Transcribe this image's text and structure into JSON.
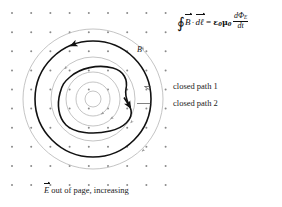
{
  "figure": {
    "equation": {
      "contour_integral_symbol": "∮",
      "lhs_field": "B",
      "dot": "·",
      "lhs_element": "dℓ",
      "equals": "=",
      "epsilon_zero": "ε",
      "epsilon_sub": "0",
      "mu_zero": "μ",
      "mu_sub": "0",
      "frac_numerator": "dΦ",
      "frac_numerator_sub": "E",
      "frac_denominator": "dt",
      "plain_text": "∮B⃗ · dℓ⃗ = ε₀μ₀ dΦ_E/dt"
    },
    "labels": {
      "b_field": "B",
      "closed_path_1": "closed path 1",
      "closed_path_2": "closed path 2",
      "caption_field": "E",
      "caption_text": "out of page, increasing"
    },
    "colors": {
      "ink": "#1a1a1a",
      "path_dark": "#111111",
      "field_line": "#b0b0b0",
      "dot": "#8a8a8a",
      "leader": "#555555",
      "background": "#ffffff"
    },
    "geometry": {
      "center_x": 93,
      "center_y": 99,
      "dot_grid": {
        "origin_x": 12,
        "origin_y": -6,
        "spacing_x": 19.2,
        "spacing_y": 19.1,
        "cols": 9,
        "rows": 11,
        "radius": 1.0
      },
      "field_line_radii": [
        8,
        17,
        27,
        42,
        58,
        70
      ],
      "closed_path_1_radius": 58,
      "closed_path_2_label": "irregular blob enclosing center",
      "arrow_direction": "counterclockwise"
    }
  }
}
